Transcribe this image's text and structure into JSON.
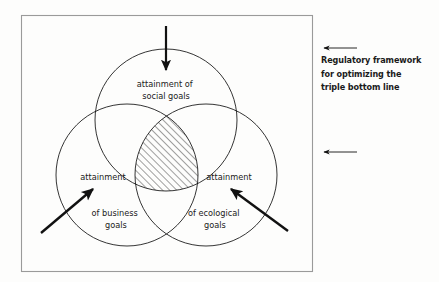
{
  "diagram": {
    "type": "venn-three-circle",
    "frame": {
      "x": 21,
      "y": 15,
      "width": 292,
      "height": 257
    },
    "circles": [
      {
        "id": "social",
        "label_lines": [
          "attainment of",
          "social goals"
        ],
        "cx": 166,
        "cy": 120,
        "r": 71,
        "label_x": 166,
        "label_y": 87
      },
      {
        "id": "business",
        "label_lines": [
          "attainment",
          "of business",
          "goals"
        ],
        "cx": 127,
        "cy": 175,
        "r": 71,
        "label_x": 103,
        "label_y": 180
      },
      {
        "id": "ecological",
        "label_lines": [
          "attainment",
          "of ecological",
          "goals"
        ],
        "cx": 206,
        "cy": 175,
        "r": 71,
        "label_x": 229,
        "label_y": 180
      }
    ],
    "intersection": {
      "name": "triple-bottom-line-core",
      "fill": "diagonal-hatch",
      "hatch_angle_deg": 45,
      "hatch_spacing_px": 5
    },
    "arrows": [
      {
        "id": "top",
        "x1": 166,
        "y1": 26,
        "x2": 166,
        "y2": 70,
        "style": "thick"
      },
      {
        "id": "lower-left",
        "x1": 41,
        "y1": 233,
        "x2": 93,
        "y2": 189,
        "style": "thick"
      },
      {
        "id": "lower-right",
        "x1": 288,
        "y1": 231,
        "x2": 231,
        "y2": 189,
        "style": "thick"
      },
      {
        "id": "caption-upper",
        "x1": 357,
        "y1": 48,
        "x2": 323,
        "y2": 48,
        "style": "thin"
      },
      {
        "id": "caption-lower",
        "x1": 357,
        "y1": 152,
        "x2": 323,
        "y2": 152,
        "style": "thin"
      }
    ],
    "stroke_color": "#111111",
    "frame_color": "#9a9a9a",
    "background": "#fdfdfc"
  },
  "caption": {
    "lines": [
      "Regulatory framework",
      "for optimizing the",
      "triple bottom line"
    ]
  }
}
